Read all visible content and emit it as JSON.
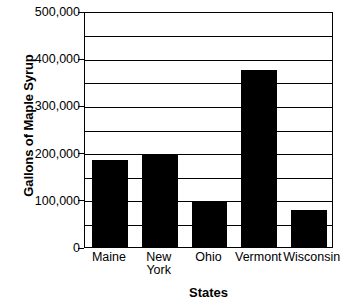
{
  "chart_data": {
    "type": "bar",
    "title": "",
    "subtitle": "",
    "xlabel": "States",
    "ylabel": "Gallons of Maple Syrup",
    "categories": [
      "Maine",
      "New York",
      "Ohio",
      "Vermont",
      "Wisconsin"
    ],
    "category_lines": [
      [
        "Maine"
      ],
      [
        "New",
        "York"
      ],
      [
        "Ohio"
      ],
      [
        "Vermont"
      ],
      [
        "Wisconsin"
      ]
    ],
    "values": [
      185000,
      195000,
      97000,
      375000,
      78000
    ],
    "ylim": [
      0,
      500000
    ],
    "ytick_labels": [
      "500,000",
      "400,000",
      "300,000",
      "200,000",
      "100,000",
      "0"
    ],
    "ytick_values": [
      500000,
      400000,
      300000,
      200000,
      100000,
      0
    ],
    "gridline_values": [
      500000,
      450000,
      400000,
      350000,
      300000,
      250000,
      200000,
      150000,
      100000,
      50000,
      0
    ],
    "gridline_interval": 50000,
    "grid": true,
    "legend": false,
    "legend_position": "none",
    "bar_color": "#000000",
    "axis_color": "#000000",
    "background_color": "#FFFFFF"
  }
}
